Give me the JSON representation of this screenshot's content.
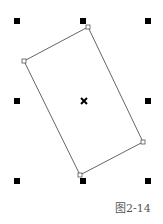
{
  "caption": "图2-14",
  "colors": {
    "handle": "#000000",
    "outline": "#666666",
    "caption": "#555555"
  },
  "shape": {
    "type": "rotated-rectangle",
    "vertices": [
      [
        88,
        27
      ],
      [
        143,
        142
      ],
      [
        80,
        175
      ],
      [
        24,
        61
      ]
    ]
  },
  "selection_handles": [
    {
      "id": "top-left",
      "x": 17,
      "y": 21
    },
    {
      "id": "top-middle",
      "x": 83,
      "y": 21
    },
    {
      "id": "top-right",
      "x": 148,
      "y": 21
    },
    {
      "id": "middle-left",
      "x": 17,
      "y": 101
    },
    {
      "id": "middle-right",
      "x": 148,
      "y": 101
    },
    {
      "id": "bottom-left",
      "x": 17,
      "y": 181
    },
    {
      "id": "bottom-middle",
      "x": 83,
      "y": 181
    },
    {
      "id": "bottom-right",
      "x": 148,
      "y": 181
    }
  ],
  "center_marker": {
    "x": 84,
    "y": 101,
    "symbol": "×"
  }
}
